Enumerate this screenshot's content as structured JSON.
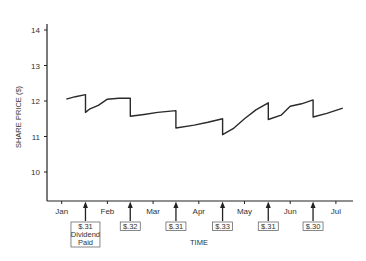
{
  "chart_data": {
    "type": "line",
    "title": "",
    "xlabel": "TIME",
    "ylabel": "SHARE PRICE ($)",
    "ylim": [
      9.2,
      14.5
    ],
    "yticks": [
      10,
      11,
      12,
      13,
      14
    ],
    "xtick_labels": [
      "Jan",
      "Feb",
      "Mar",
      "Apr",
      "May",
      "Jun",
      "Jul"
    ],
    "grid": false,
    "legend": null,
    "series": [
      {
        "name": "Share price",
        "points": [
          {
            "t": 0.1,
            "y": 12.05
          },
          {
            "t": 0.3,
            "y": 12.12
          },
          {
            "t": 0.52,
            "y": 12.18
          },
          {
            "t": 0.52,
            "y": 11.68
          },
          {
            "t": 0.62,
            "y": 11.78
          },
          {
            "t": 0.8,
            "y": 11.88
          },
          {
            "t": 1.0,
            "y": 12.05
          },
          {
            "t": 1.25,
            "y": 12.08
          },
          {
            "t": 1.5,
            "y": 12.08
          },
          {
            "t": 1.5,
            "y": 11.57
          },
          {
            "t": 1.8,
            "y": 11.62
          },
          {
            "t": 2.1,
            "y": 11.68
          },
          {
            "t": 2.5,
            "y": 11.73
          },
          {
            "t": 2.5,
            "y": 11.24
          },
          {
            "t": 2.9,
            "y": 11.32
          },
          {
            "t": 3.2,
            "y": 11.4
          },
          {
            "t": 3.52,
            "y": 11.5
          },
          {
            "t": 3.52,
            "y": 11.05
          },
          {
            "t": 3.75,
            "y": 11.22
          },
          {
            "t": 4.0,
            "y": 11.5
          },
          {
            "t": 4.25,
            "y": 11.75
          },
          {
            "t": 4.52,
            "y": 11.95
          },
          {
            "t": 4.52,
            "y": 11.48
          },
          {
            "t": 4.8,
            "y": 11.6
          },
          {
            "t": 5.0,
            "y": 11.85
          },
          {
            "t": 5.25,
            "y": 11.92
          },
          {
            "t": 5.5,
            "y": 12.03
          },
          {
            "t": 5.5,
            "y": 11.55
          },
          {
            "t": 5.8,
            "y": 11.65
          },
          {
            "t": 6.15,
            "y": 11.8
          }
        ]
      }
    ],
    "dividends": [
      {
        "t": 0.52,
        "label": "$.31",
        "note": [
          "Dividend",
          "Paid"
        ]
      },
      {
        "t": 1.5,
        "label": "$.32"
      },
      {
        "t": 2.5,
        "label": "$.31"
      },
      {
        "t": 3.52,
        "label": "$.33"
      },
      {
        "t": 4.52,
        "label": "$.31"
      },
      {
        "t": 5.5,
        "label": "$.30"
      }
    ]
  }
}
